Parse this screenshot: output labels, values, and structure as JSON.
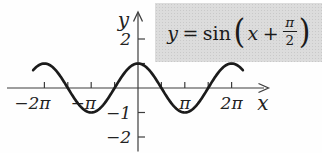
{
  "equation_box": {
    "full_text": "y = sin(x + π/2)",
    "lhs_var": "y",
    "equals": "=",
    "function_name": "sin",
    "open_paren": "(",
    "arg_var": "x",
    "plus": "+",
    "fraction_numerator": "π",
    "fraction_denominator": "2",
    "close_paren": ")"
  },
  "chart_data": {
    "type": "line",
    "title": "",
    "equation": "y = sin(x + π/2)",
    "function": {
      "form": "y = A·sin(x + φ)",
      "amplitude": 1,
      "phase_over_pi": 0.5
    },
    "xlabel": "x",
    "ylabel": "y",
    "x_domain_pi": [
      -2.24,
      2.24
    ],
    "axis_range": {
      "x_pi": [
        -2.8,
        2.8
      ],
      "y": [
        -2.6,
        3.1
      ]
    },
    "grid": false,
    "legend": false,
    "x_ticks": [
      {
        "pi": -2,
        "label": "−2π"
      },
      {
        "pi": -1.5,
        "label": ""
      },
      {
        "pi": -1,
        "label": "−π"
      },
      {
        "pi": -0.5,
        "label": ""
      },
      {
        "pi": 0.5,
        "label": ""
      },
      {
        "pi": 1,
        "label": "π"
      },
      {
        "pi": 1.5,
        "label": ""
      },
      {
        "pi": 2,
        "label": "2π"
      }
    ],
    "y_ticks": [
      {
        "value": 2,
        "label": "2"
      },
      {
        "value": 1,
        "label": ""
      },
      {
        "value": -1,
        "label": "−1"
      },
      {
        "value": -2,
        "label": "−2"
      }
    ],
    "key_points": [
      {
        "x": "−2π",
        "y": 1
      },
      {
        "x": "−π",
        "y": -1
      },
      {
        "x": "0",
        "y": 1
      },
      {
        "x": "π",
        "y": -1
      },
      {
        "x": "2π",
        "y": 1
      }
    ],
    "colors": {
      "curve": "#1b1b1b",
      "axis": "#3d3d3d",
      "text": "#222222",
      "box_bg": "#d5d5d5"
    }
  }
}
